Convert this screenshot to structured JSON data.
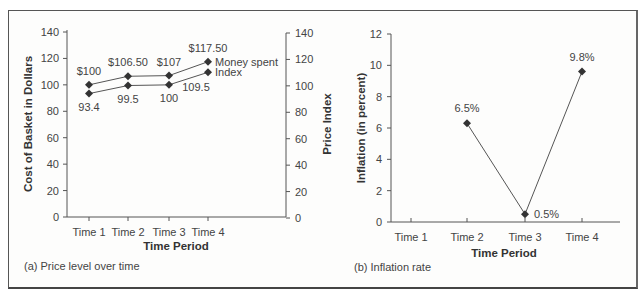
{
  "chart_data": [
    {
      "id": "a",
      "type": "line",
      "caption": "(a) Price level over time",
      "xlabel": "Time Period",
      "ylabel": "Cost of Basket in Dollars",
      "y2label": "Price Index",
      "categories": [
        "Time 1",
        "Time 2",
        "Time 3",
        "Time 4"
      ],
      "ylim": [
        0,
        140
      ],
      "y2lim": [
        0,
        140
      ],
      "yticks": [
        0,
        20,
        40,
        60,
        80,
        100,
        120,
        140
      ],
      "grid": false,
      "legend_position": "inline-right-of-last-point",
      "series": [
        {
          "name": "Money spent",
          "values": [
            100,
            106.5,
            107,
            117.5
          ],
          "labels": [
            "$100",
            "$106.50",
            "$107",
            "$117.50"
          ],
          "label_position": "above"
        },
        {
          "name": "Index",
          "values": [
            93.4,
            99.5,
            100,
            109.5
          ],
          "labels": [
            "93.4",
            "99.5",
            "100",
            "109.5"
          ],
          "label_position": "below"
        }
      ]
    },
    {
      "id": "b",
      "type": "line",
      "caption": "(b) Inflation rate",
      "xlabel": "Time Period",
      "ylabel": "Inflation (in percent)",
      "categories": [
        "Time 1",
        "Time 2",
        "Time 3",
        "Time 4"
      ],
      "ylim": [
        0,
        12
      ],
      "yticks": [
        0,
        2,
        4,
        6,
        8,
        10,
        12
      ],
      "grid": false,
      "series": [
        {
          "name": "Inflation rate",
          "values": [
            null,
            6.3,
            0.5,
            9.6
          ],
          "labels": [
            null,
            "6.5%",
            "0.5%",
            "9.8%"
          ]
        }
      ]
    }
  ],
  "colors": {
    "line": "#555555",
    "marker": "#333333",
    "axis": "#555555",
    "text": "#444444"
  }
}
